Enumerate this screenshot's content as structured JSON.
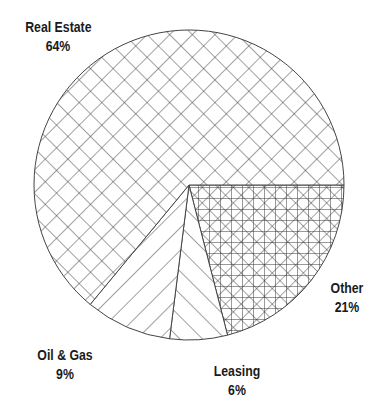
{
  "chart_data": {
    "type": "pie",
    "title": "",
    "start_angle_deg": 0,
    "direction": "clockwise",
    "categories": [
      "Other",
      "Leasing",
      "Oil & Gas",
      "Real Estate"
    ],
    "values": [
      21,
      6,
      9,
      64
    ],
    "units": "%",
    "slices": [
      {
        "label": "Other",
        "value": 21,
        "display": "21%",
        "pattern": "grid-crosshatch-dense"
      },
      {
        "label": "Leasing",
        "value": 6,
        "display": "6%",
        "pattern": "diagonal-backslash"
      },
      {
        "label": "Oil & Gas",
        "value": 9,
        "display": "9%",
        "pattern": "diagonal-slash"
      },
      {
        "label": "Real Estate",
        "value": 64,
        "display": "64%",
        "pattern": "diagonal-crosshatch"
      }
    ],
    "legend": "none (direct labels)",
    "colors": {
      "line": "#333333",
      "background": "#ffffff",
      "text": "#1a1a1a"
    }
  },
  "labels": {
    "real_estate": {
      "name": "Real Estate",
      "pct": "64%"
    },
    "other": {
      "name": "Other",
      "pct": "21%"
    },
    "leasing": {
      "name": "Leasing",
      "pct": "6%"
    },
    "oil_gas": {
      "name": "Oil & Gas",
      "pct": "9%"
    }
  }
}
